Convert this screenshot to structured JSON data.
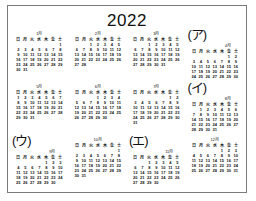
{
  "title": "2022",
  "weekdays": [
    "日",
    "月",
    "火",
    "水",
    "木",
    "金",
    "土"
  ],
  "months": [
    {
      "label": "1月",
      "tag": "",
      "weeks": [
        [
          "",
          "",
          "",
          "",
          "",
          "",
          "1"
        ],
        [
          "2",
          "3",
          "4",
          "5",
          "6",
          "7",
          "8"
        ],
        [
          "9",
          "10",
          "11",
          "12",
          "13",
          "14",
          "15"
        ],
        [
          "16",
          "17",
          "18",
          "19",
          "20",
          "21",
          "22"
        ],
        [
          "23",
          "24",
          "25",
          "26",
          "27",
          "28",
          "29"
        ],
        [
          "30",
          "31",
          "",
          "",
          "",
          "",
          ""
        ]
      ]
    },
    {
      "label": "2月",
      "tag": "",
      "weeks": [
        [
          "",
          "",
          "1",
          "2",
          "3",
          "4",
          "5"
        ],
        [
          "6",
          "7",
          "8",
          "9",
          "10",
          "11",
          "12"
        ],
        [
          "13",
          "14",
          "15",
          "16",
          "17",
          "18",
          "19"
        ],
        [
          "20",
          "21",
          "22",
          "23",
          "24",
          "25",
          "26"
        ],
        [
          "27",
          "28",
          "",
          "",
          "",
          "",
          ""
        ],
        [
          "",
          "",
          "",
          "",
          "",
          "",
          ""
        ]
      ]
    },
    {
      "label": "3月",
      "tag": "",
      "weeks": [
        [
          "",
          "",
          "1",
          "2",
          "3",
          "4",
          "5"
        ],
        [
          "6",
          "7",
          "8",
          "9",
          "10",
          "11",
          "12"
        ],
        [
          "13",
          "14",
          "15",
          "16",
          "17",
          "18",
          "19"
        ],
        [
          "20",
          "21",
          "22",
          "23",
          "24",
          "25",
          "26"
        ],
        [
          "27",
          "28",
          "29",
          "30",
          "31",
          "",
          ""
        ],
        [
          "",
          "",
          "",
          "",
          "",
          "",
          ""
        ]
      ]
    },
    {
      "label": "4月",
      "tag": "(ア)",
      "weeks": [
        [
          "",
          "",
          "",
          "",
          "",
          "1",
          "2"
        ],
        [
          "3",
          "4",
          "5",
          "6",
          "7",
          "8",
          "9"
        ],
        [
          "10",
          "11",
          "12",
          "13",
          "14",
          "15",
          "16"
        ],
        [
          "17",
          "18",
          "19",
          "20",
          "21",
          "22",
          "23"
        ],
        [
          "24",
          "25",
          "26",
          "27",
          "28",
          "29",
          "30"
        ],
        [
          "",
          "",
          "",
          "",
          "",
          "",
          ""
        ]
      ]
    },
    {
      "label": "5月",
      "tag": "",
      "weeks": [
        [
          "1",
          "2",
          "3",
          "4",
          "5",
          "6",
          "7"
        ],
        [
          "8",
          "9",
          "10",
          "11",
          "12",
          "13",
          "14"
        ],
        [
          "15",
          "16",
          "17",
          "18",
          "19",
          "20",
          "21"
        ],
        [
          "22",
          "23",
          "24",
          "25",
          "26",
          "27",
          "28"
        ],
        [
          "29",
          "30",
          "31",
          "",
          "",
          "",
          ""
        ],
        [
          "",
          "",
          "",
          "",
          "",
          "",
          ""
        ]
      ]
    },
    {
      "label": "6月",
      "tag": "",
      "weeks": [
        [
          "",
          "",
          "",
          "1",
          "2",
          "3",
          "4"
        ],
        [
          "5",
          "6",
          "7",
          "8",
          "9",
          "10",
          "11"
        ],
        [
          "12",
          "13",
          "14",
          "15",
          "16",
          "17",
          "18"
        ],
        [
          "19",
          "20",
          "21",
          "22",
          "23",
          "24",
          "25"
        ],
        [
          "26",
          "27",
          "28",
          "29",
          "30",
          "",
          ""
        ],
        [
          "",
          "",
          "",
          "",
          "",
          "",
          ""
        ]
      ]
    },
    {
      "label": "7月",
      "tag": "",
      "weeks": [
        [
          "",
          "",
          "",
          "",
          "",
          "1",
          "2"
        ],
        [
          "3",
          "4",
          "5",
          "6",
          "7",
          "8",
          "9"
        ],
        [
          "10",
          "11",
          "12",
          "13",
          "14",
          "15",
          "16"
        ],
        [
          "17",
          "18",
          "19",
          "20",
          "21",
          "22",
          "23"
        ],
        [
          "24",
          "25",
          "26",
          "27",
          "28",
          "29",
          "30"
        ],
        [
          "31",
          "",
          "",
          "",
          "",
          "",
          ""
        ]
      ]
    },
    {
      "label": "8月",
      "tag": "(イ)",
      "weeks": [
        [
          "",
          "1",
          "2",
          "3",
          "4",
          "5",
          "6"
        ],
        [
          "7",
          "8",
          "9",
          "10",
          "11",
          "12",
          "13"
        ],
        [
          "14",
          "15",
          "16",
          "17",
          "18",
          "19",
          "20"
        ],
        [
          "21",
          "22",
          "23",
          "24",
          "25",
          "26",
          "27"
        ],
        [
          "28",
          "29",
          "30",
          "31",
          "",
          "",
          ""
        ],
        [
          "",
          "",
          "",
          "",
          "",
          "",
          ""
        ]
      ]
    },
    {
      "label": "9月",
      "tag": "(ウ)",
      "weeks": [
        [
          "",
          "",
          "",
          "",
          "1",
          "2",
          "3"
        ],
        [
          "4",
          "5",
          "6",
          "7",
          "8",
          "9",
          "10"
        ],
        [
          "11",
          "12",
          "13",
          "14",
          "15",
          "16",
          "17"
        ],
        [
          "18",
          "19",
          "20",
          "21",
          "22",
          "23",
          "24"
        ],
        [
          "25",
          "26",
          "27",
          "28",
          "29",
          "30",
          ""
        ],
        [
          "",
          "",
          "",
          "",
          "",
          "",
          ""
        ]
      ]
    },
    {
      "label": "10月",
      "tag": "",
      "weeks": [
        [
          "",
          "",
          "",
          "",
          "",
          "",
          "1"
        ],
        [
          "2",
          "3",
          "4",
          "5",
          "6",
          "7",
          "8"
        ],
        [
          "9",
          "10",
          "11",
          "12",
          "13",
          "14",
          "15"
        ],
        [
          "16",
          "17",
          "18",
          "19",
          "20",
          "21",
          "22"
        ],
        [
          "23",
          "24",
          "25",
          "26",
          "27",
          "28",
          "29"
        ],
        [
          "30",
          "31",
          "",
          "",
          "",
          "",
          ""
        ]
      ]
    },
    {
      "label": "11月",
      "tag": "(エ)",
      "weeks": [
        [
          "",
          "",
          "1",
          "2",
          "3",
          "4",
          "5"
        ],
        [
          "6",
          "7",
          "8",
          "9",
          "10",
          "11",
          "12"
        ],
        [
          "13",
          "14",
          "15",
          "16",
          "17",
          "18",
          "19"
        ],
        [
          "20",
          "21",
          "22",
          "23",
          "24",
          "25",
          "26"
        ],
        [
          "27",
          "28",
          "29",
          "30",
          "",
          "",
          ""
        ],
        [
          "",
          "",
          "",
          "",
          "",
          "",
          ""
        ]
      ]
    },
    {
      "label": "12月",
      "tag": "",
      "weeks": [
        [
          "",
          "",
          "",
          "",
          "1",
          "2",
          "3"
        ],
        [
          "4",
          "5",
          "6",
          "7",
          "8",
          "9",
          "10"
        ],
        [
          "11",
          "12",
          "13",
          "14",
          "15",
          "16",
          "17"
        ],
        [
          "18",
          "19",
          "20",
          "21",
          "22",
          "23",
          "24"
        ],
        [
          "25",
          "26",
          "27",
          "28",
          "29",
          "30",
          "31"
        ],
        [
          "",
          "",
          "",
          "",
          "",
          "",
          ""
        ]
      ]
    }
  ]
}
